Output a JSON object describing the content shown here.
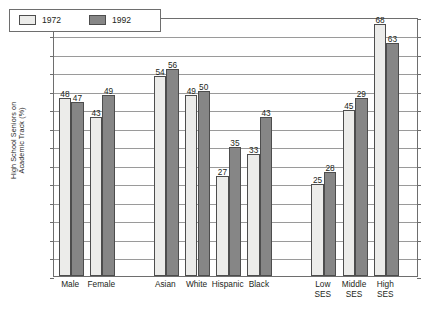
{
  "chart_data": {
    "type": "bar",
    "title": "",
    "xlabel": "",
    "ylabel": "High School Seniors on Academic Track (%)",
    "ylabel_line1": "High School Seniors on",
    "ylabel_line2": "Academic Track (%)",
    "ylim": [
      0,
      70
    ],
    "ytick_step": 5,
    "yticks": [
      0,
      5,
      10,
      15,
      20,
      25,
      30,
      35,
      40,
      45,
      50,
      55,
      60,
      65,
      70
    ],
    "grid": true,
    "legend_position": "top-left",
    "categories": [
      "Male",
      "Female",
      "Asian",
      "White",
      "Hispanic",
      "Black",
      "Low SES",
      "Middle SES",
      "High SES"
    ],
    "category_labels": [
      [
        "Male"
      ],
      [
        "Female"
      ],
      [
        "Asian"
      ],
      [
        "White"
      ],
      [
        "Hispanic"
      ],
      [
        "Black"
      ],
      [
        "Low",
        "SES"
      ],
      [
        "Middle",
        "SES"
      ],
      [
        "High",
        "SES"
      ]
    ],
    "series": [
      {
        "name": "1972",
        "color": "#ececea",
        "values": [
          48,
          43,
          54,
          49,
          27,
          33,
          25,
          45,
          68
        ],
        "labels": [
          "48",
          "43",
          "54",
          "49",
          "27",
          "33",
          "25",
          "45",
          "68"
        ]
      },
      {
        "name": "1992",
        "color": "#868686",
        "values": [
          47,
          49,
          56,
          50,
          35,
          43,
          28,
          48,
          63
        ],
        "labels": [
          "47",
          "49",
          "56",
          "50",
          "35",
          "43",
          "28",
          "29",
          "63"
        ]
      }
    ],
    "group_gaps_after": [
      "Female",
      "Black"
    ]
  },
  "legend": {
    "items": [
      {
        "label": "1972",
        "swatch": "light-swatch"
      },
      {
        "label": "1992",
        "swatch": "dark-swatch"
      }
    ]
  },
  "caption": {
    "text": ""
  }
}
